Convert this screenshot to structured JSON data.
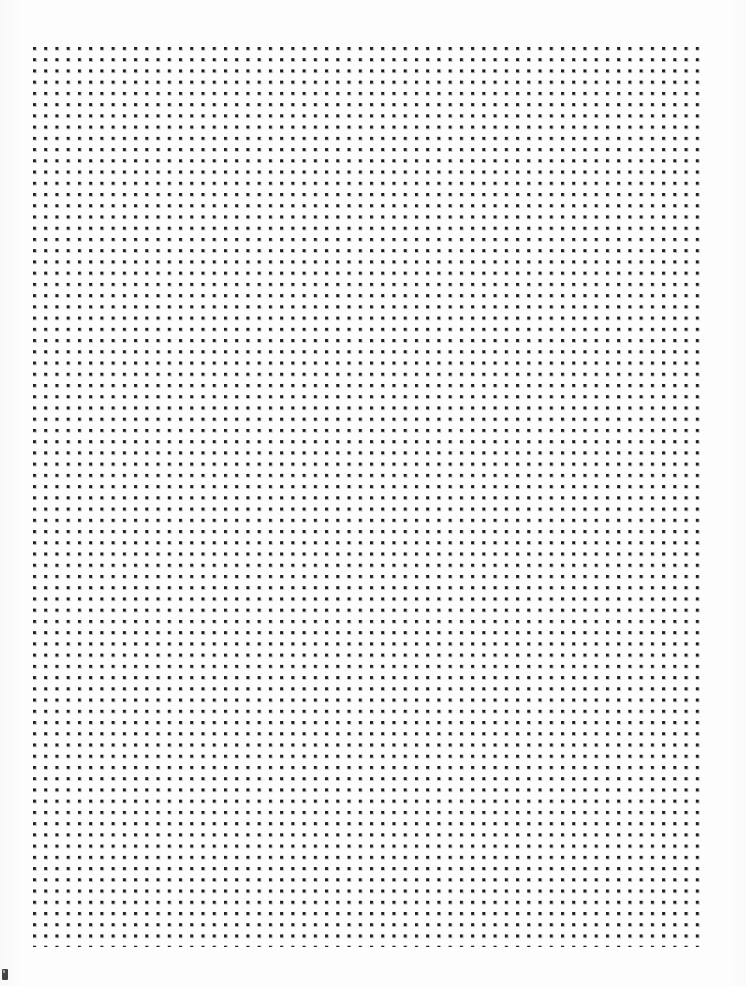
{
  "document": {
    "kind": "scanned-dot-grid-page",
    "page_width": 746,
    "page_height": 986,
    "background_color": "#fdfdfd",
    "caption": ""
  },
  "grid": {
    "label": "",
    "dot_color": "#1a1a1a",
    "dot_size_px": 3,
    "spacing_px": 11.24,
    "left_px": 33,
    "top_px": 47,
    "right_px": 707,
    "bottom_px": 947,
    "columns": 61,
    "rows": 81
  },
  "margins": {
    "top_label": "",
    "left_label": "",
    "right_label": "",
    "bottom_label": ""
  },
  "artifact": {
    "label": "",
    "left_px": 2,
    "top_px": 969,
    "width_px": 6,
    "height_px": 11,
    "color": "#2b2b2b"
  }
}
